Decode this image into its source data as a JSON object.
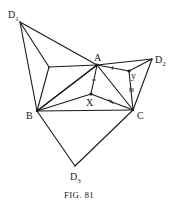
{
  "figure": {
    "caption": "Fig. 81",
    "caption_display": "FIG. 81"
  },
  "points": {
    "A": {
      "label": "A",
      "x": 97,
      "y": 65
    },
    "B": {
      "label": "B",
      "x": 37,
      "y": 111
    },
    "C": {
      "label": "C",
      "x": 133,
      "y": 110
    },
    "D1": {
      "label": "D",
      "sub": "1",
      "x": 20,
      "y": 22
    },
    "D2": {
      "label": "D",
      "sub": "2",
      "x": 152,
      "y": 59
    },
    "D3": {
      "label": "D",
      "sub": "3",
      "x": 75,
      "y": 166
    },
    "X": {
      "label": "X",
      "x": 91,
      "y": 94
    },
    "Y": {
      "label": "y",
      "x": 129,
      "y": 71
    },
    "F1": {
      "label": "",
      "x": 49,
      "y": 67
    }
  },
  "labels": {
    "A": "A",
    "B": "B",
    "C": "C",
    "D1_main": "D",
    "D1_sub": "1",
    "D2_main": "D",
    "D2_sub": "2",
    "D3_main": "D",
    "D3_sub": "3",
    "X": "X",
    "Y": "y"
  },
  "colors": {
    "line": "#1a1a1a",
    "background": "#ffffff"
  }
}
